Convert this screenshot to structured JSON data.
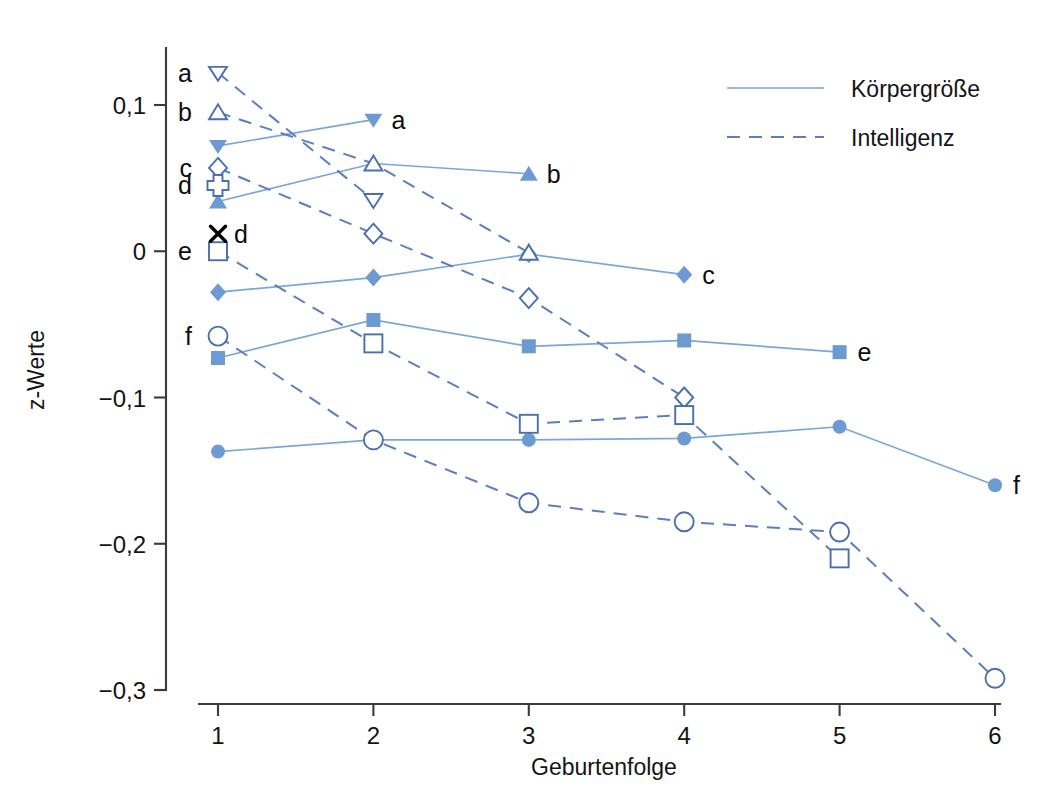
{
  "chart_data": {
    "type": "line",
    "title": "",
    "xlabel": "Geburtenfolge",
    "ylabel": "z-Werte",
    "x": [
      1,
      2,
      3,
      4,
      5,
      6
    ],
    "xtick_labels": [
      "1",
      "2",
      "3",
      "4",
      "5",
      "6"
    ],
    "ytick_labels": [
      "0,1",
      "0",
      "−0,1",
      "−0,2",
      "−0,3"
    ],
    "ytick_values": [
      0.1,
      0,
      -0.1,
      -0.2,
      -0.3
    ],
    "ylim": [
      -0.32,
      0.135
    ],
    "xlim": [
      0.88,
      6.25
    ],
    "grid": false,
    "legend_position": "top-right",
    "legend": [
      {
        "label": "Körpergröße",
        "style": "solid",
        "color": "#7ba7d7"
      },
      {
        "label": "Intelligenz",
        "style": "dashed",
        "color": "#5b7fbe"
      }
    ],
    "series": [
      {
        "name": "a-koerper",
        "group": "Körpergröße",
        "style": "solid",
        "marker": "triangle-down-filled",
        "end_label": "a",
        "x": [
          1,
          2
        ],
        "values": [
          0.072,
          0.09
        ]
      },
      {
        "name": "b-koerper",
        "group": "Körpergröße",
        "style": "solid",
        "marker": "triangle-up-filled",
        "end_label": "b",
        "x": [
          1,
          2,
          3
        ],
        "values": [
          0.034,
          0.06,
          0.053
        ]
      },
      {
        "name": "c-koerper",
        "group": "Körpergröße",
        "style": "solid",
        "marker": "diamond-filled",
        "end_label": "c",
        "x": [
          1,
          2,
          3,
          4
        ],
        "values": [
          -0.028,
          -0.018,
          -0.002,
          -0.016
        ]
      },
      {
        "name": "e-koerper",
        "group": "Körpergröße",
        "style": "solid",
        "marker": "square-filled",
        "end_label": "e",
        "x": [
          1,
          2,
          3,
          4,
          5
        ],
        "values": [
          -0.073,
          -0.047,
          -0.065,
          -0.061,
          -0.069
        ]
      },
      {
        "name": "f-koerper",
        "group": "Körpergröße",
        "style": "solid",
        "marker": "circle-filled",
        "end_label": "f",
        "x": [
          1,
          2,
          3,
          4,
          5,
          6
        ],
        "values": [
          -0.137,
          -0.129,
          -0.129,
          -0.128,
          -0.12,
          -0.16
        ]
      },
      {
        "name": "a-intelligenz",
        "group": "Intelligenz",
        "style": "dashed",
        "marker": "triangle-down-open",
        "end_label": "",
        "x": [
          1,
          2
        ],
        "values": [
          0.122,
          0.035
        ]
      },
      {
        "name": "b-intelligenz",
        "group": "Intelligenz",
        "style": "dashed",
        "marker": "triangle-up-open",
        "end_label": "",
        "x": [
          1,
          2,
          3
        ],
        "values": [
          0.095,
          0.06,
          -0.001
        ]
      },
      {
        "name": "c-intelligenz",
        "group": "Intelligenz",
        "style": "dashed",
        "marker": "diamond-open",
        "end_label": "",
        "x": [
          1,
          2,
          3,
          4
        ],
        "values": [
          0.057,
          0.012,
          -0.032,
          -0.1
        ]
      },
      {
        "name": "d-intelligenz",
        "group": "Intelligenz",
        "style": "dashed",
        "marker": "cross-open",
        "end_label": "",
        "x": [
          1
        ],
        "values": [
          0.045
        ]
      },
      {
        "name": "e-intelligenz",
        "group": "Intelligenz",
        "style": "dashed",
        "marker": "square-open",
        "end_label": "",
        "x": [
          1,
          2,
          3,
          4,
          5
        ],
        "values": [
          0.0,
          -0.063,
          -0.118,
          -0.112,
          -0.21
        ]
      },
      {
        "name": "f-intelligenz",
        "group": "Intelligenz",
        "style": "dashed",
        "marker": "circle-open",
        "end_label": "",
        "x": [
          1,
          2,
          3,
          4,
          5,
          6
        ],
        "values": [
          -0.058,
          -0.129,
          -0.172,
          -0.185,
          -0.192,
          -0.292
        ]
      }
    ],
    "left_labels": [
      {
        "text": "a",
        "value": 0.122
      },
      {
        "text": "b",
        "value": 0.095
      },
      {
        "text": "c",
        "value": 0.057
      },
      {
        "text": "d",
        "value": 0.045
      },
      {
        "text": "e",
        "value": 0.0
      },
      {
        "text": "f",
        "value": -0.058
      }
    ],
    "annotations": [
      {
        "text": "d",
        "marker": "x-black",
        "x": 1,
        "value": 0.012
      }
    ],
    "end_labels": [
      {
        "text": "a",
        "x": 2,
        "value": 0.09
      },
      {
        "text": "b",
        "x": 3,
        "value": 0.053
      },
      {
        "text": "c",
        "x": 4,
        "value": -0.016
      },
      {
        "text": "e",
        "x": 5,
        "value": -0.069
      },
      {
        "text": "f",
        "x": 6,
        "value": -0.16
      }
    ]
  }
}
